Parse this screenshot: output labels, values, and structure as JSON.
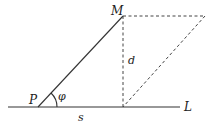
{
  "diagram": {
    "labels": {
      "point_m": "M",
      "point_p": "P",
      "line_l": "L",
      "distance_d": "d",
      "segment_s": "s",
      "angle_phi": "φ"
    },
    "elements": [
      {
        "id": "line-L",
        "style": "solid",
        "meaning": "horizontal line L"
      },
      {
        "id": "segment-PM",
        "style": "solid",
        "meaning": "segment from P to M"
      },
      {
        "id": "perpendicular-d",
        "style": "dashed",
        "meaning": "perpendicular from M to L"
      },
      {
        "id": "parallel-top",
        "style": "dashed",
        "meaning": "line through M parallel to L"
      },
      {
        "id": "parallel-diagonal",
        "style": "dashed",
        "meaning": "line parallel to PM through foot of perpendicular"
      },
      {
        "id": "angle-arc",
        "style": "solid",
        "meaning": "angle phi at P between L and PM"
      }
    ],
    "colors": {
      "line": "#333333",
      "text": "#222222",
      "background": "#ffffff"
    }
  }
}
